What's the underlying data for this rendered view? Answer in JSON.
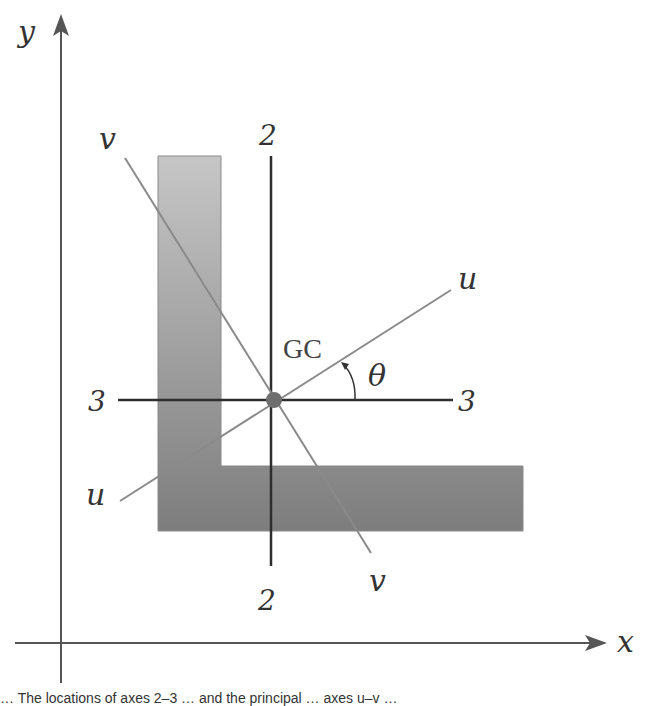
{
  "figure": {
    "axes": {
      "x_label": "x",
      "y_label": "y"
    },
    "centroid_label": "GC",
    "angle_label": "θ",
    "centroidal_axes": {
      "horizontal": {
        "left_label": "3",
        "right_label": "3"
      },
      "vertical": {
        "top_label": "2",
        "bottom_label": "2"
      }
    },
    "principal_axes": {
      "u": {
        "start_label": "u",
        "end_label": "u"
      },
      "v": {
        "start_label": "v",
        "end_label": "v"
      }
    },
    "colors": {
      "section_top": "#c4c4c4",
      "section_bottom": "#7f7f7f",
      "axis": "#555555",
      "centroid_lines": "#2e2e2e",
      "principal_lines": "#8a8a8a",
      "centroid_dot": "#6e6e6e"
    }
  },
  "caption": "… The locations of axes 2–3 … and the principal … axes u–v …"
}
